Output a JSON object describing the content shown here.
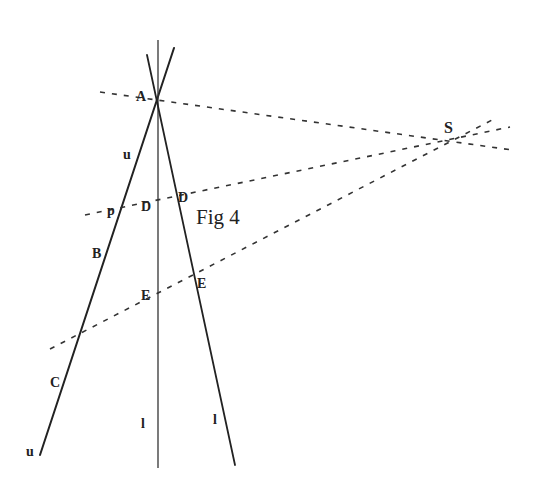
{
  "figure": {
    "caption": "Fig 4",
    "labels": {
      "A": "A",
      "S": "S",
      "u_top": "u",
      "p": "p",
      "B": "B",
      "D_left": "D",
      "D_right": "D",
      "E_left": "E",
      "E_right": "E",
      "C": "C",
      "u_bottom": "u",
      "l_left": "l",
      "l_right": "l"
    },
    "colors": {
      "ink": "#222222",
      "background": "#ffffff"
    }
  }
}
